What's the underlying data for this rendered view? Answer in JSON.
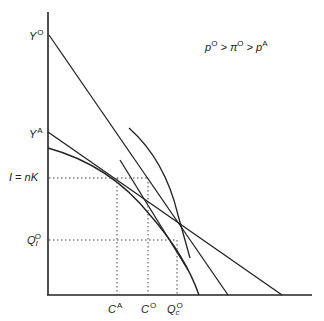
{
  "diagram": {
    "annotation": {
      "p_O": "p",
      "p_O_sup": "O",
      "gt1": " > ",
      "pi_O": "π",
      "pi_O_sup": "O",
      "gt2": " > ",
      "p_A": "p",
      "p_A_sup": "A"
    },
    "y_axis_labels": {
      "Y_O": {
        "base": "Y",
        "sup": "O"
      },
      "Y_A": {
        "base": "Y",
        "sup": "A"
      },
      "I_nK": {
        "text": "I = nK"
      },
      "Q1_O": {
        "base": "Q",
        "sub": "I",
        "sup": "O"
      }
    },
    "x_axis_labels": {
      "C_A": {
        "base": "C",
        "sup": "A"
      },
      "C_O": {
        "base": "C",
        "sup": "O"
      },
      "Qc_O": {
        "base": "Q",
        "sub": "c",
        "sup": "O"
      }
    },
    "colors": {
      "line": "#222222",
      "dotted": "#444444",
      "background": "#ffffff"
    }
  }
}
